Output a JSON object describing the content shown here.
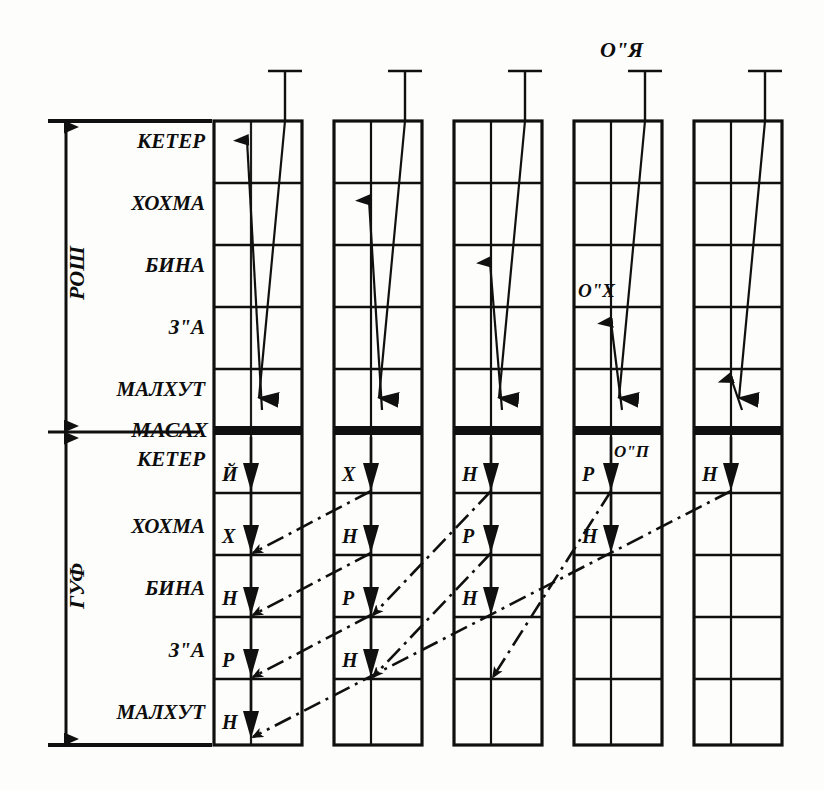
{
  "diagram": {
    "title_marks": {
      "top_right_annotation": "O\"Я",
      "mid_annotation": "O\"Х",
      "lower_annotation": "O\"П"
    },
    "side_brackets": [
      {
        "id": "rosh",
        "label": "РОШ",
        "span_from": "КЕТЕР",
        "span_to": "МАСАХ"
      },
      {
        "id": "guf",
        "label": "ГУФ",
        "span_from": "МАСАХ",
        "span_to": "МАЛХУТ"
      }
    ],
    "divider_label": "МАСАХ",
    "upper_row_labels": [
      "КЕТЕР",
      "ХОХМА",
      "БИНА",
      "З\"А",
      "МАЛХУТ"
    ],
    "lower_row_labels": [
      "КЕТЕР",
      "ХОХМА",
      "БИНА",
      "З\"А",
      "МАЛХУТ"
    ],
    "columns": [
      {
        "index": 1,
        "upper_arrow_target_row": 1,
        "lower_letters": [
          "Й",
          "Х",
          "Н",
          "Р",
          "Н"
        ]
      },
      {
        "index": 2,
        "upper_arrow_target_row": 2,
        "lower_letters": [
          "Х",
          "Н",
          "Р",
          "Н"
        ]
      },
      {
        "index": 3,
        "upper_arrow_target_row": 3,
        "lower_letters": [
          "Н",
          "Р",
          "Н"
        ]
      },
      {
        "index": 4,
        "upper_arrow_target_row": 4,
        "lower_letters": [
          "Р",
          "Н"
        ]
      },
      {
        "index": 5,
        "upper_arrow_target_row": 5,
        "lower_letters": [
          "Н"
        ]
      }
    ],
    "colors": {
      "ink": "#101010",
      "paper": "#fdfdfb",
      "divider": "#101010"
    }
  }
}
